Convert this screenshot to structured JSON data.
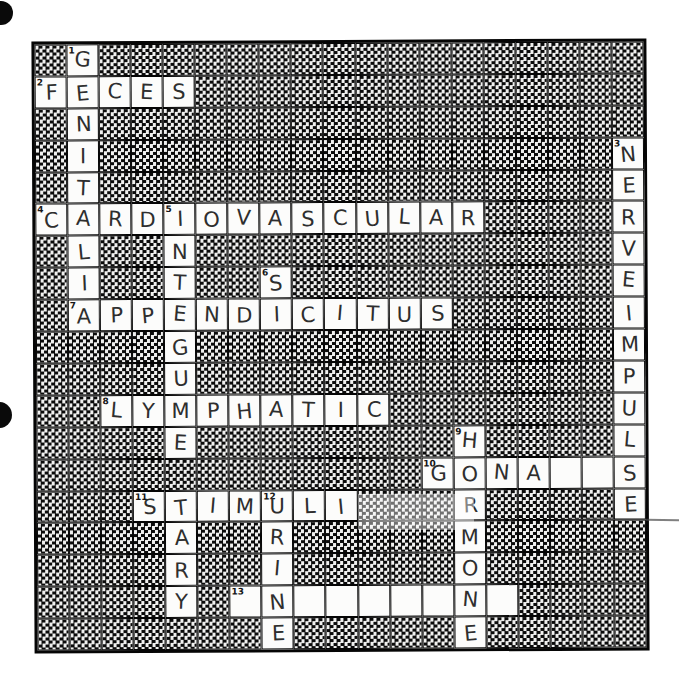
{
  "document_type": "scanned crossword puzzle worksheet, handwritten pencil answers, body-systems theme",
  "colors": {
    "paper": "#ffffff",
    "checker_dark": "#0b0b0b",
    "checker_light": "#f0f0ef",
    "open_cell": "#fcfcfb",
    "pencil_ink": "#2e2e2e",
    "grid_line": "#050505"
  },
  "grid": {
    "rows": 19,
    "cols": 19,
    "clue_numbers_visible": [
      "1",
      "2",
      "3",
      "4",
      "5",
      "6",
      "7",
      "8",
      "9",
      "10",
      "11",
      "12",
      "13"
    ],
    "cells": [
      {
        "r": 0,
        "c": 1,
        "num": "1",
        "letter": "G"
      },
      {
        "r": 1,
        "c": 0,
        "num": "2",
        "letter": "F"
      },
      {
        "r": 1,
        "c": 1,
        "num": "",
        "letter": "E"
      },
      {
        "r": 1,
        "c": 2,
        "num": "",
        "letter": "C"
      },
      {
        "r": 1,
        "c": 3,
        "num": "",
        "letter": "E"
      },
      {
        "r": 1,
        "c": 4,
        "num": "",
        "letter": "S"
      },
      {
        "r": 2,
        "c": 1,
        "num": "",
        "letter": "N"
      },
      {
        "r": 3,
        "c": 1,
        "num": "",
        "letter": "I"
      },
      {
        "r": 3,
        "c": 18,
        "num": "3",
        "letter": "N"
      },
      {
        "r": 4,
        "c": 1,
        "num": "",
        "letter": "T"
      },
      {
        "r": 4,
        "c": 18,
        "num": "",
        "letter": "E"
      },
      {
        "r": 5,
        "c": 0,
        "num": "4",
        "letter": "C"
      },
      {
        "r": 5,
        "c": 1,
        "num": "",
        "letter": "A"
      },
      {
        "r": 5,
        "c": 2,
        "num": "",
        "letter": "R"
      },
      {
        "r": 5,
        "c": 3,
        "num": "",
        "letter": "D"
      },
      {
        "r": 5,
        "c": 4,
        "num": "5",
        "letter": "I"
      },
      {
        "r": 5,
        "c": 5,
        "num": "",
        "letter": "O"
      },
      {
        "r": 5,
        "c": 6,
        "num": "",
        "letter": "V"
      },
      {
        "r": 5,
        "c": 7,
        "num": "",
        "letter": "A"
      },
      {
        "r": 5,
        "c": 8,
        "num": "",
        "letter": "S"
      },
      {
        "r": 5,
        "c": 9,
        "num": "",
        "letter": "C"
      },
      {
        "r": 5,
        "c": 10,
        "num": "",
        "letter": "U"
      },
      {
        "r": 5,
        "c": 11,
        "num": "",
        "letter": "L"
      },
      {
        "r": 5,
        "c": 12,
        "num": "",
        "letter": "A"
      },
      {
        "r": 5,
        "c": 13,
        "num": "",
        "letter": "R"
      },
      {
        "r": 5,
        "c": 18,
        "num": "",
        "letter": "R"
      },
      {
        "r": 6,
        "c": 1,
        "num": "",
        "letter": "L"
      },
      {
        "r": 6,
        "c": 4,
        "num": "",
        "letter": "N"
      },
      {
        "r": 6,
        "c": 18,
        "num": "",
        "letter": "V"
      },
      {
        "r": 7,
        "c": 1,
        "num": "",
        "letter": "I"
      },
      {
        "r": 7,
        "c": 4,
        "num": "",
        "letter": "T"
      },
      {
        "r": 7,
        "c": 7,
        "num": "6",
        "letter": "S"
      },
      {
        "r": 7,
        "c": 18,
        "num": "",
        "letter": "E"
      },
      {
        "r": 8,
        "c": 1,
        "num": "7",
        "letter": "A"
      },
      {
        "r": 8,
        "c": 2,
        "num": "",
        "letter": "P"
      },
      {
        "r": 8,
        "c": 3,
        "num": "",
        "letter": "P"
      },
      {
        "r": 8,
        "c": 4,
        "num": "",
        "letter": "E"
      },
      {
        "r": 8,
        "c": 5,
        "num": "",
        "letter": "N"
      },
      {
        "r": 8,
        "c": 6,
        "num": "",
        "letter": "D"
      },
      {
        "r": 8,
        "c": 7,
        "num": "",
        "letter": "I"
      },
      {
        "r": 8,
        "c": 8,
        "num": "",
        "letter": "C"
      },
      {
        "r": 8,
        "c": 9,
        "num": "",
        "letter": "I"
      },
      {
        "r": 8,
        "c": 10,
        "num": "",
        "letter": "T"
      },
      {
        "r": 8,
        "c": 11,
        "num": "",
        "letter": "U"
      },
      {
        "r": 8,
        "c": 12,
        "num": "",
        "letter": "S"
      },
      {
        "r": 8,
        "c": 18,
        "num": "",
        "letter": "I"
      },
      {
        "r": 9,
        "c": 4,
        "num": "",
        "letter": "G"
      },
      {
        "r": 9,
        "c": 18,
        "num": "",
        "letter": "M"
      },
      {
        "r": 10,
        "c": 4,
        "num": "",
        "letter": "U"
      },
      {
        "r": 10,
        "c": 18,
        "num": "",
        "letter": "P"
      },
      {
        "r": 11,
        "c": 2,
        "num": "8",
        "letter": "L"
      },
      {
        "r": 11,
        "c": 3,
        "num": "",
        "letter": "Y"
      },
      {
        "r": 11,
        "c": 4,
        "num": "",
        "letter": "M"
      },
      {
        "r": 11,
        "c": 5,
        "num": "",
        "letter": "P"
      },
      {
        "r": 11,
        "c": 6,
        "num": "",
        "letter": "H"
      },
      {
        "r": 11,
        "c": 7,
        "num": "",
        "letter": "A"
      },
      {
        "r": 11,
        "c": 8,
        "num": "",
        "letter": "T"
      },
      {
        "r": 11,
        "c": 9,
        "num": "",
        "letter": "I"
      },
      {
        "r": 11,
        "c": 10,
        "num": "",
        "letter": "C"
      },
      {
        "r": 11,
        "c": 18,
        "num": "",
        "letter": "U"
      },
      {
        "r": 12,
        "c": 4,
        "num": "",
        "letter": "E"
      },
      {
        "r": 12,
        "c": 13,
        "num": "9",
        "letter": "H"
      },
      {
        "r": 12,
        "c": 18,
        "num": "",
        "letter": "L"
      },
      {
        "r": 13,
        "c": 12,
        "num": "10",
        "letter": "G"
      },
      {
        "r": 13,
        "c": 13,
        "num": "",
        "letter": "O"
      },
      {
        "r": 13,
        "c": 14,
        "num": "",
        "letter": "N"
      },
      {
        "r": 13,
        "c": 15,
        "num": "",
        "letter": "A"
      },
      {
        "r": 13,
        "c": 16,
        "num": "",
        "letter": ""
      },
      {
        "r": 13,
        "c": 17,
        "num": "",
        "letter": ""
      },
      {
        "r": 13,
        "c": 18,
        "num": "",
        "letter": "S"
      },
      {
        "r": 14,
        "c": 3,
        "num": "11",
        "letter": "S"
      },
      {
        "r": 14,
        "c": 4,
        "num": "",
        "letter": "T"
      },
      {
        "r": 14,
        "c": 5,
        "num": "",
        "letter": "I"
      },
      {
        "r": 14,
        "c": 6,
        "num": "",
        "letter": "M"
      },
      {
        "r": 14,
        "c": 7,
        "num": "12",
        "letter": "U"
      },
      {
        "r": 14,
        "c": 8,
        "num": "",
        "letter": "L"
      },
      {
        "r": 14,
        "c": 9,
        "num": "",
        "letter": "I"
      },
      {
        "r": 14,
        "c": 13,
        "num": "",
        "letter": "R"
      },
      {
        "r": 14,
        "c": 18,
        "num": "",
        "letter": "E"
      },
      {
        "r": 15,
        "c": 4,
        "num": "",
        "letter": "A"
      },
      {
        "r": 15,
        "c": 7,
        "num": "",
        "letter": "R"
      },
      {
        "r": 15,
        "c": 13,
        "num": "",
        "letter": "M"
      },
      {
        "r": 16,
        "c": 4,
        "num": "",
        "letter": "R"
      },
      {
        "r": 16,
        "c": 7,
        "num": "",
        "letter": "I"
      },
      {
        "r": 16,
        "c": 13,
        "num": "",
        "letter": "O"
      },
      {
        "r": 17,
        "c": 4,
        "num": "",
        "letter": "Y"
      },
      {
        "r": 17,
        "c": 6,
        "num": "13",
        "letter": ""
      },
      {
        "r": 17,
        "c": 7,
        "num": "",
        "letter": "N"
      },
      {
        "r": 17,
        "c": 8,
        "num": "",
        "letter": ""
      },
      {
        "r": 17,
        "c": 9,
        "num": "",
        "letter": ""
      },
      {
        "r": 17,
        "c": 10,
        "num": "",
        "letter": ""
      },
      {
        "r": 17,
        "c": 11,
        "num": "",
        "letter": ""
      },
      {
        "r": 17,
        "c": 12,
        "num": "",
        "letter": ""
      },
      {
        "r": 17,
        "c": 13,
        "num": "",
        "letter": "N"
      },
      {
        "r": 17,
        "c": 14,
        "num": "",
        "letter": ""
      },
      {
        "r": 18,
        "c": 7,
        "num": "",
        "letter": "E"
      },
      {
        "r": 18,
        "c": 13,
        "num": "",
        "letter": "E"
      }
    ],
    "words_as_written": {
      "across": {
        "2": "FECES",
        "4": "CARDIOVASCULAR",
        "7": "APPENDICITUS",
        "8": "LYMPHATIC",
        "10": "GONA__S (cells 5-6 left blank)",
        "11": "STIMULI",
        "13": "_N_____N_ (only crossing letters filled)"
      },
      "down": {
        "1": "GENITALIA",
        "3": "NERVEIMPULSE",
        "5": "INTEGUMENTARY",
        "6": "SI (partial)",
        "9": "HORMONE",
        "12": "URINE"
      }
    }
  }
}
